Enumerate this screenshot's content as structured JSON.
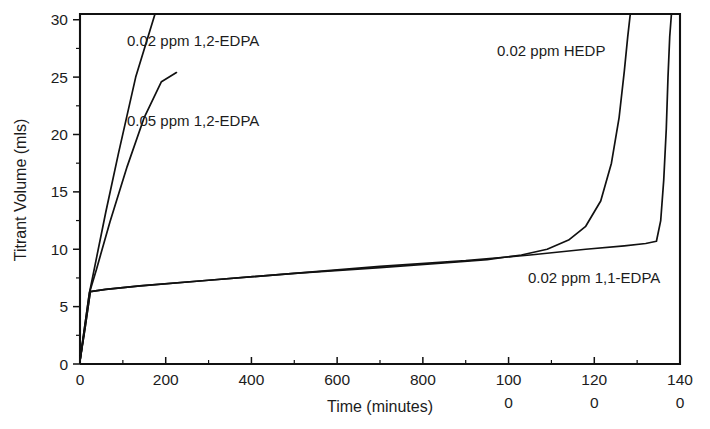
{
  "chart_data": {
    "type": "line",
    "title": "",
    "xlabel": "Time (minutes)",
    "ylabel": "Titrant Volume (mls)",
    "xlim": [
      0,
      1400
    ],
    "ylim": [
      0,
      30.5
    ],
    "grid": false,
    "legend_position": "inline-annotations",
    "x_ticks": [
      0,
      200,
      400,
      600,
      800,
      1000,
      1200,
      1400
    ],
    "x_tick_labels": [
      "0",
      "200",
      "400",
      "600",
      "800",
      "100\n0",
      "120\n0",
      "140\n0"
    ],
    "x_tick_labels_line1": [
      "0",
      "200",
      "400",
      "600",
      "800",
      "100",
      "120",
      "140"
    ],
    "x_tick_labels_line2": [
      "",
      "",
      "",
      "",
      "",
      "0",
      "0",
      "0"
    ],
    "x_minor_tick_interval": 100,
    "y_ticks": [
      0,
      5,
      10,
      15,
      20,
      25,
      30
    ],
    "y_tick_labels": [
      "0",
      "5",
      "10",
      "15",
      "20",
      "25",
      "30"
    ],
    "y_minor_tick_interval": 2.5,
    "series": [
      {
        "name": "0.02 ppm 1,2-EDPA",
        "label": "0.02 ppm 1,2-EDPA",
        "label_x": 127,
        "label_y": 46,
        "color": "#111111",
        "x": [
          0,
          10,
          22,
          35,
          60,
          90,
          130,
          175,
          215,
          250
        ],
        "y": [
          0.3,
          3.0,
          6.2,
          8.6,
          13.2,
          18.4,
          25.0,
          30.5,
          30.5,
          30.5
        ],
        "clipped_at_top": true
      },
      {
        "name": "0.05 ppm 1,2-EDPA",
        "label": "0.05 ppm 1,2-EDPA",
        "label_x": 127,
        "label_y": 126,
        "color": "#111111",
        "x": [
          0,
          10,
          22,
          38,
          70,
          110,
          150,
          190,
          225
        ],
        "y": [
          0.3,
          3.0,
          6.2,
          8.2,
          12.4,
          17.2,
          21.5,
          24.6,
          25.4
        ],
        "clipped_at_top": false
      },
      {
        "name": "0.02 ppm HEDP",
        "label": "0.02 ppm HEDP",
        "label_x": 497,
        "label_y": 56,
        "color": "#111111",
        "x": [
          0,
          12,
          24,
          60,
          140,
          300,
          500,
          700,
          850,
          950,
          1030,
          1090,
          1140,
          1180,
          1215,
          1240,
          1258,
          1270,
          1278,
          1284
        ],
        "y": [
          0.3,
          3.2,
          6.3,
          6.5,
          6.8,
          7.3,
          7.9,
          8.4,
          8.8,
          9.1,
          9.5,
          10.0,
          10.8,
          12.0,
          14.2,
          17.5,
          21.5,
          25.5,
          28.5,
          30.5
        ],
        "clipped_at_top": true
      },
      {
        "name": "0.02 ppm 1,1-EDPA",
        "label": "0.02 ppm 1,1-EDPA",
        "label_x": 528,
        "label_y": 283,
        "color": "#111111",
        "x": [
          0,
          12,
          24,
          60,
          140,
          300,
          500,
          700,
          900,
          1050,
          1180,
          1270,
          1320,
          1345,
          1355,
          1362,
          1368,
          1372,
          1376,
          1380
        ],
        "y": [
          0.3,
          3.2,
          6.3,
          6.5,
          6.8,
          7.3,
          7.9,
          8.5,
          9.0,
          9.5,
          10.0,
          10.3,
          10.5,
          10.7,
          12.5,
          16.0,
          20.5,
          25.0,
          28.5,
          30.5
        ],
        "clipped_at_top": true
      }
    ],
    "annotations": [
      {
        "text": "0.02 ppm 1,2-EDPA",
        "x": 127,
        "y": 46
      },
      {
        "text": "0.05 ppm 1,2-EDPA",
        "x": 127,
        "y": 126
      },
      {
        "text": "0.02 ppm HEDP",
        "x": 497,
        "y": 56
      },
      {
        "text": "0.02 ppm 1,1-EDPA",
        "x": 528,
        "y": 283
      }
    ]
  },
  "axes": {
    "x_title": "Time (minutes)",
    "y_title": "Titrant Volume (mls)"
  },
  "colors": {
    "curve": "#111111",
    "frame": "#111111",
    "text": "#1c1c1c",
    "background": "#ffffff"
  }
}
